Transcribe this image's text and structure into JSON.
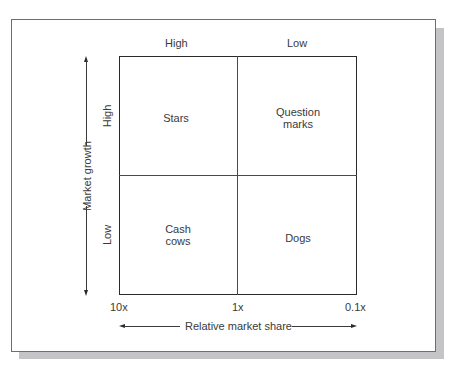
{
  "diagram": {
    "type": "2x2 matrix",
    "column_headers": [
      "High",
      "Low"
    ],
    "row_headers": [
      "High",
      "Low"
    ],
    "quadrants": {
      "top_left": "Stars",
      "top_right_line1": "Question",
      "top_right_line2": "marks",
      "bottom_left_line1": "Cash",
      "bottom_left_line2": "cows",
      "bottom_right": "Dogs"
    },
    "x_axis": {
      "label": "Relative market share",
      "ticks": [
        "10x",
        "1x",
        "0.1x"
      ]
    },
    "y_axis": {
      "label": "Market growth"
    }
  },
  "colors": {
    "background": "#ffffff",
    "frame_border": "#6e6e6e",
    "shadow": "#c4c4c6",
    "lines": "#2a2a2a",
    "text": "#3a3a3a"
  }
}
